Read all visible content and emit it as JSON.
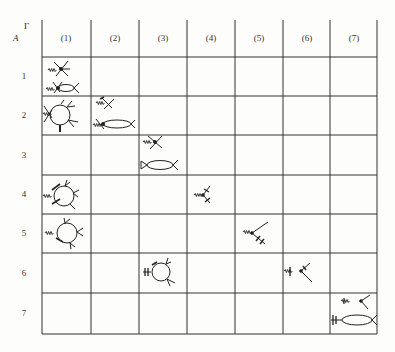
{
  "table": {
    "corner_labels": {
      "column_axis": "Γ",
      "row_axis": "A"
    },
    "columns": [
      "(1)",
      "(2)",
      "(3)",
      "(4)",
      "(5)",
      "(6)",
      "(7)"
    ],
    "rows": [
      "1",
      "2",
      "3",
      "4",
      "5",
      "6",
      "7"
    ],
    "cells": [
      {
        "row": "1",
        "col": "(1)",
        "content": "two tree diagrams: wavy line into 4-leg vertex; wavy line into vertex with bubble"
      },
      {
        "row": "2",
        "col": "(1)",
        "content": "one-loop diagram with wavy external line and several external legs"
      },
      {
        "row": "2",
        "col": "(2)",
        "content": "crossed-vertex tree diagram and bubble diagram"
      },
      {
        "row": "3",
        "col": "(3)",
        "content": "tree diagram and bubble diagram"
      },
      {
        "row": "4",
        "col": "(1)",
        "content": "one-loop diagram with crossed legs"
      },
      {
        "row": "4",
        "col": "(4)",
        "content": "tree diagram with crossed legs"
      },
      {
        "row": "5",
        "col": "(1)",
        "content": "one-loop diagram with crossed legs"
      },
      {
        "row": "5",
        "col": "(5)",
        "content": "tree diagram with double-crossed leg"
      },
      {
        "row": "6",
        "col": "(3)",
        "content": "one-loop diagram with barred external line"
      },
      {
        "row": "6",
        "col": "(6)",
        "content": "tree diagram with barred external line"
      },
      {
        "row": "7",
        "col": "(7)",
        "content": "tree diagram and bubble diagram with barred external line"
      }
    ]
  },
  "colors": {
    "ink": "#222222",
    "paper": "#fdfdfb"
  }
}
